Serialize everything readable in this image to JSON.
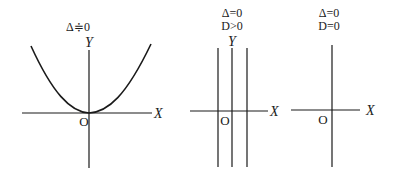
{
  "panels": [
    {
      "id": "panel-1",
      "condition_line1": "Δ≑0",
      "condition_line2": "",
      "y_label": "Y",
      "x_label": "X",
      "origin_label": "O",
      "graph": "parabola tangent to X-axis at origin"
    },
    {
      "id": "panel-2",
      "condition_line1": "Δ=0",
      "condition_line2": "D>0",
      "y_label": "Y",
      "x_label": "X",
      "origin_label": "O",
      "graph": "two parallel vertical lines symmetric about Y-axis"
    },
    {
      "id": "panel-3",
      "condition_line1": "Δ=0",
      "condition_line2": "D=0",
      "y_label": "",
      "x_label": "X",
      "origin_label": "O",
      "graph": "single vertical line coinciding with Y-axis"
    }
  ],
  "colors": {
    "ink": "#1a1a1a",
    "background": "#ffffff"
  }
}
